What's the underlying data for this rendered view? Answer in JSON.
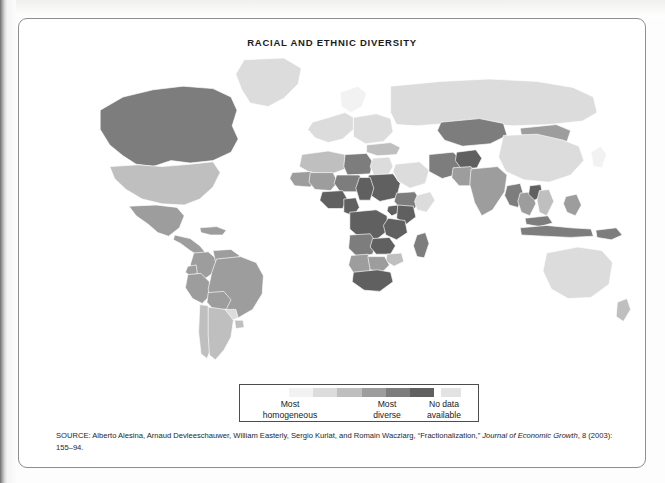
{
  "figure": {
    "title": "RACIAL AND ETHNIC DIVERSITY",
    "source_prefix": "SOURCE: Alberto Alesina, Arnaud Devleeschauwer, William Easterly, Sergio Kurlat, and Romain Wacziarg, “Fractionalization,” ",
    "source_italic": "Journal of Economic Growth",
    "source_suffix": ", 8 (2003): 155–94."
  },
  "legend": {
    "most_homogeneous_line1": "Most",
    "most_homogeneous_line2": "homogeneous",
    "most_diverse_line1": "Most",
    "most_diverse_line2": "diverse",
    "no_data_line1": "No data",
    "no_data_line2": "available",
    "ramp_colors": [
      "#f2f2f2",
      "#dcdcdc",
      "#bfbfbf",
      "#9d9d9d",
      "#7d7d7d",
      "#606060"
    ],
    "no_data_color": "#e3e3e3"
  },
  "chart_data": {
    "type": "map",
    "title": "RACIAL AND ETHNIC DIVERSITY",
    "projection": "world-equirectangular",
    "value_name": "ethnic fractionalization index",
    "scale": {
      "kind": "sequential-gray",
      "low_label": "Most homogeneous",
      "high_label": "Most diverse",
      "bins": [
        {
          "level": 1,
          "color": "#f2f2f2",
          "meaning": "most homogeneous"
        },
        {
          "level": 2,
          "color": "#dcdcdc",
          "meaning": "low diversity"
        },
        {
          "level": 3,
          "color": "#bfbfbf",
          "meaning": "moderate diversity"
        },
        {
          "level": 4,
          "color": "#9d9d9d",
          "meaning": "high diversity"
        },
        {
          "level": 5,
          "color": "#7d7d7d",
          "meaning": "very high diversity"
        },
        {
          "level": 6,
          "color": "#606060",
          "meaning": "most diverse"
        }
      ],
      "no_data": {
        "color": "#e3e3e3",
        "meaning": "No data available"
      }
    },
    "regions": [
      {
        "name": "Canada",
        "level": 5
      },
      {
        "name": "United States",
        "level": 3
      },
      {
        "name": "Mexico",
        "level": 4
      },
      {
        "name": "Greenland",
        "level": 2
      },
      {
        "name": "Central America",
        "level": 4
      },
      {
        "name": "Caribbean",
        "level": 4
      },
      {
        "name": "Colombia",
        "level": 4
      },
      {
        "name": "Venezuela",
        "level": 4
      },
      {
        "name": "Brazil",
        "level": 4
      },
      {
        "name": "Peru",
        "level": 4
      },
      {
        "name": "Bolivia",
        "level": 4
      },
      {
        "name": "Ecuador",
        "level": 4
      },
      {
        "name": "Argentina",
        "level": 3
      },
      {
        "name": "Chile",
        "level": 3
      },
      {
        "name": "Paraguay",
        "level": 2
      },
      {
        "name": "Uruguay",
        "level": 3
      },
      {
        "name": "Western Europe",
        "level": 2
      },
      {
        "name": "Eastern Europe",
        "level": 2
      },
      {
        "name": "Russia",
        "level": 2
      },
      {
        "name": "Scandinavia",
        "level": 1
      },
      {
        "name": "North Africa",
        "level": 3
      },
      {
        "name": "Libya",
        "level": 5
      },
      {
        "name": "Egypt",
        "level": 2
      },
      {
        "name": "Sudan",
        "level": 6
      },
      {
        "name": "Chad",
        "level": 6
      },
      {
        "name": "Nigeria",
        "level": 6
      },
      {
        "name": "Cameroon",
        "level": 6
      },
      {
        "name": "DR Congo",
        "level": 6
      },
      {
        "name": "Kenya",
        "level": 6
      },
      {
        "name": "Tanzania",
        "level": 6
      },
      {
        "name": "Uganda",
        "level": 6
      },
      {
        "name": "Ethiopia",
        "level": 5
      },
      {
        "name": "Somalia",
        "level": 2
      },
      {
        "name": "South Africa",
        "level": 6
      },
      {
        "name": "Zambia",
        "level": 6
      },
      {
        "name": "Angola",
        "level": 5
      },
      {
        "name": "Mali",
        "level": 4
      },
      {
        "name": "Niger",
        "level": 5
      },
      {
        "name": "Mauritania",
        "level": 4
      },
      {
        "name": "Madagascar",
        "level": 5
      },
      {
        "name": "Botswana",
        "level": 4
      },
      {
        "name": "Namibia",
        "level": 4
      },
      {
        "name": "Zimbabwe",
        "level": 3
      },
      {
        "name": "Turkey",
        "level": 3
      },
      {
        "name": "Iran",
        "level": 5
      },
      {
        "name": "Afghanistan",
        "level": 6
      },
      {
        "name": "Pakistan",
        "level": 4
      },
      {
        "name": "India",
        "level": 4
      },
      {
        "name": "Kazakhstan",
        "level": 5
      },
      {
        "name": "Mongolia",
        "level": 4
      },
      {
        "name": "China",
        "level": 2
      },
      {
        "name": "Japan",
        "level": 1
      },
      {
        "name": "Indonesia",
        "level": 5
      },
      {
        "name": "Malaysia",
        "level": 5
      },
      {
        "name": "Philippines",
        "level": 4
      },
      {
        "name": "Thailand",
        "level": 4
      },
      {
        "name": "Vietnam",
        "level": 3
      },
      {
        "name": "Laos",
        "level": 6
      },
      {
        "name": "Myanmar",
        "level": 5
      },
      {
        "name": "Papua New Guinea",
        "level": 5
      },
      {
        "name": "Australia",
        "level": 2
      },
      {
        "name": "New Zealand",
        "level": 3
      },
      {
        "name": "Saudi Arabia",
        "level": 2
      },
      {
        "name": "Antarctica",
        "level": 0
      }
    ]
  }
}
